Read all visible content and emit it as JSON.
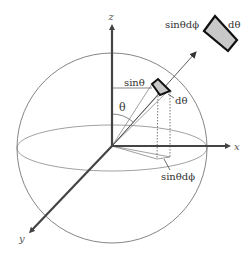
{
  "diagram": {
    "axes": {
      "z_label": "z",
      "x_label": "x",
      "y_label": "y"
    },
    "angle_label": "θ",
    "labels": {
      "small_patch_width": "sinθ",
      "small_patch_height": "dθ",
      "projection": "sinθdϕ",
      "big_patch_width": "sinθdϕ",
      "big_patch_height": "dθ"
    },
    "colors": {
      "axis": "#444444",
      "line": "#555555",
      "patch_fill": "#c8c8c8",
      "patch_stroke": "#111111",
      "background": "#ffffff"
    }
  }
}
